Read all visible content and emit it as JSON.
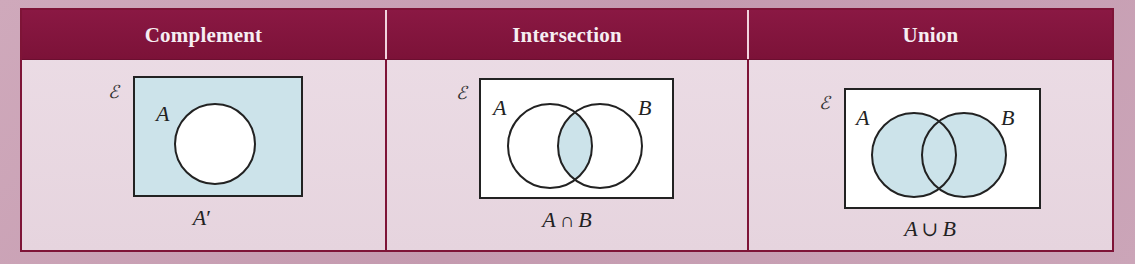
{
  "colors": {
    "header_bg": "#83143d",
    "header_text": "#f6eef2",
    "border": "#7e1437",
    "cell_bg": "#e9d9e2",
    "shade": "#cce3ea",
    "universe_fill": "#ffffff",
    "outline": "#222222"
  },
  "table": {
    "columns": [
      {
        "header": "Complement",
        "universal_symbol": "ℰ",
        "set_labels": [
          "A"
        ],
        "shaded_region": "outside A",
        "caption": {
          "left": "A",
          "op": "′",
          "right": ""
        }
      },
      {
        "header": "Intersection",
        "universal_symbol": "ℰ",
        "set_labels": [
          "A",
          "B"
        ],
        "shaded_region": "A and B overlap",
        "caption": {
          "left": "A",
          "op": "∩",
          "right": "B"
        }
      },
      {
        "header": "Union",
        "universal_symbol": "ℰ",
        "set_labels": [
          "A",
          "B"
        ],
        "shaded_region": "A or B",
        "caption": {
          "left": "A",
          "op": "∪",
          "right": "B"
        }
      }
    ]
  }
}
